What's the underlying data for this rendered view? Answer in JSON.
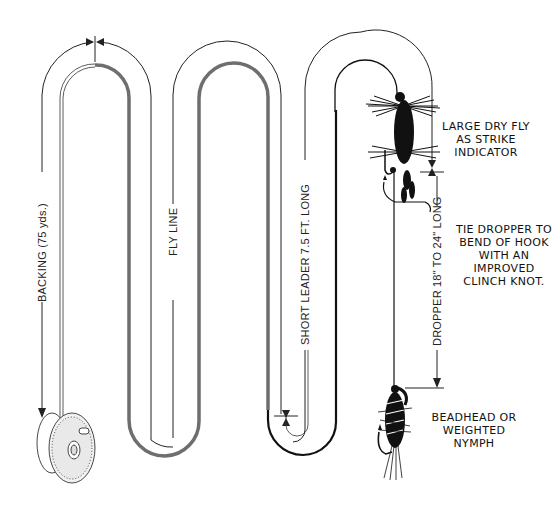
{
  "diagram": {
    "labels": {
      "backing": "BACKING (75 yds.)",
      "fly_line": "FLY LINE",
      "leader": "SHORT LEADER 7.5 FT. LONG",
      "dropper": "DROPPER 18\" TO 24\" LONG"
    },
    "callouts": {
      "dry_fly": [
        "LARGE DRY FLY",
        "AS STRIKE",
        "INDICATOR"
      ],
      "knot": [
        "TIE DROPPER TO",
        "BEND OF HOOK",
        "WITH AN",
        "IMPROVED",
        "CLINCH KNOT."
      ],
      "nymph": [
        "BEADHEAD OR",
        "WEIGHTED",
        "NYMPH"
      ]
    },
    "components": [
      "reel",
      "backing",
      "fly line",
      "leader",
      "dry fly",
      "dropper tippet",
      "beadhead nymph"
    ],
    "colors": {
      "line_ink": "#222222",
      "fly_line_gray": "#6e6e6e",
      "background": "#ffffff"
    }
  }
}
